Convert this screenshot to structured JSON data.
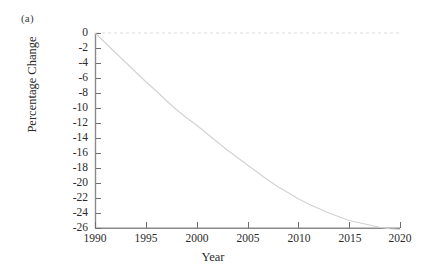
{
  "figure": {
    "panel_label": "(a)",
    "background": "#ffffff"
  },
  "axes": {
    "xlabel": "Year",
    "ylabel": "Percentage Change",
    "xticks": [
      "1990",
      "1995",
      "2000",
      "2005",
      "2010",
      "2015",
      "2020"
    ],
    "yticks": [
      "0",
      "-2",
      "-4",
      "-6",
      "-8",
      "-10",
      "-12",
      "-14",
      "-16",
      "-18",
      "-20",
      "-22",
      "-24",
      "-26"
    ],
    "axis_color": "#808080",
    "tick_color": "#6e6e6e"
  },
  "chart_data": {
    "type": "line",
    "title": "(a)",
    "xlabel": "Year",
    "ylabel": "Percentage Change",
    "xlim": [
      1990,
      2020
    ],
    "ylim": [
      -26,
      0
    ],
    "grid": false,
    "legend": null,
    "xticks": [
      1990,
      1995,
      2000,
      2005,
      2010,
      2015,
      2020
    ],
    "yticks": [
      0,
      -2,
      -4,
      -6,
      -8,
      -10,
      -12,
      -14,
      -16,
      -18,
      -20,
      -22,
      -24,
      -26
    ],
    "series": [
      {
        "name": "Percentage Change",
        "color": "#d2d2d2",
        "linewidth": 1,
        "x": [
          1990,
          1991,
          1992,
          1993,
          1994,
          1995,
          1996,
          1997,
          1998,
          1999,
          2000,
          2001,
          2002,
          2003,
          2004,
          2005,
          2006,
          2007,
          2008,
          2009,
          2010,
          2011,
          2012,
          2013,
          2014,
          2015,
          2016,
          2017,
          2018,
          2019,
          2020
        ],
        "y": [
          0.0,
          -1.3,
          -2.6,
          -3.9,
          -5.2,
          -6.5,
          -7.7,
          -9.0,
          -10.2,
          -11.3,
          -12.3,
          -13.4,
          -14.5,
          -15.6,
          -16.6,
          -17.6,
          -18.6,
          -19.6,
          -20.5,
          -21.3,
          -22.1,
          -22.8,
          -23.4,
          -24.0,
          -24.5,
          -25.0,
          -25.3,
          -25.6,
          -25.9,
          -26.1,
          -26.2
        ]
      }
    ],
    "annotations": [
      {
        "name": "zero-reference-line",
        "type": "hline",
        "y": 0,
        "style": "dotted",
        "color": "#dcdcdc"
      }
    ]
  }
}
